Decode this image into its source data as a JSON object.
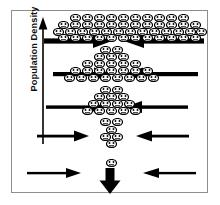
{
  "figure": {
    "title": "Population Density selection funnel diagram",
    "background_color": "#ffffff",
    "frame_color": "#8d8d8d",
    "ink_color": "#000000"
  },
  "y_axis": {
    "label": "Population Density",
    "direction": "up",
    "arrow_icon": "up-arrow-icon",
    "meaning_high": "high density at top",
    "meaning_low": "low density at bottom"
  },
  "chart_data": {
    "type": "diagram",
    "title": "Population Density",
    "xlabel": "",
    "ylabel": "Population Density",
    "grid": false,
    "legend": false,
    "levels": [
      {
        "index": 1,
        "y": 40,
        "population_count": 62,
        "density": "very high",
        "left_arrow": {
          "x_start": 48,
          "x_end": 108,
          "length": 60,
          "thickness": 5
        },
        "right_arrow": {
          "x_start": 196,
          "x_end": 124,
          "length": 72,
          "thickness": 5
        },
        "gap_between_arrows": 16
      },
      {
        "index": 2,
        "y": 73,
        "population_count": 26,
        "density": "high",
        "left_arrow": {
          "x_start": 57,
          "x_end": 108,
          "length": 51,
          "thickness": 4
        },
        "right_arrow": {
          "x_start": 190,
          "x_end": 124,
          "length": 66,
          "thickness": 4
        },
        "gap_between_arrows": 16
      },
      {
        "index": 3,
        "y": 106,
        "population_count": 18,
        "density": "medium",
        "left_arrow": {
          "x_start": 50,
          "x_end": 106,
          "length": 56,
          "thickness": 3
        },
        "right_arrow": {
          "x_start": 180,
          "x_end": 124,
          "length": 56,
          "thickness": 3
        },
        "gap_between_arrows": 18
      },
      {
        "index": 4,
        "y": 135,
        "population_count": 5,
        "density": "low",
        "left_arrow": {
          "x_start": 41,
          "x_end": 89,
          "length": 48,
          "thickness": 2.6
        },
        "right_arrow": {
          "x_start": 186,
          "x_end": 137,
          "length": 49,
          "thickness": 2.6
        },
        "gap_between_arrows": 48
      },
      {
        "index": 5,
        "y": 172,
        "population_count": 1,
        "density": "very low",
        "left_arrow": {
          "x_start": 30,
          "x_end": 80,
          "length": 50,
          "thickness": 2.2
        },
        "right_arrow": {
          "x_start": 193,
          "x_end": 143,
          "length": 50,
          "thickness": 2.2
        },
        "gap_between_arrows": 63
      }
    ],
    "outcome": {
      "icon": "thick-down-arrow-icon",
      "x": 110,
      "y": 181,
      "meaning": "single surviving individual passes through"
    },
    "person_icon": {
      "name": "person-face-icon",
      "width": 11,
      "height": 8,
      "fill": "#ffffff",
      "stroke": "#000000",
      "total_drawn": 112
    }
  },
  "crowd_rows": [
    {
      "y": 14,
      "xs": [
        70,
        82,
        94,
        106,
        118,
        130,
        142,
        154,
        166,
        178
      ]
    },
    {
      "y": 21,
      "xs": [
        58,
        70,
        82,
        94,
        106,
        118,
        130,
        142,
        154,
        166,
        178,
        190
      ]
    },
    {
      "y": 28,
      "xs": [
        53,
        65,
        77,
        89,
        101,
        113,
        125,
        137,
        149,
        161,
        173,
        185,
        196
      ]
    },
    {
      "y": 34,
      "xs": [
        58,
        70,
        82,
        94,
        106,
        118,
        130,
        142,
        154,
        166,
        178,
        190
      ]
    },
    {
      "y": 46,
      "xs": [
        100,
        112
      ]
    },
    {
      "y": 53,
      "xs": [
        94,
        106,
        118
      ]
    },
    {
      "y": 60,
      "xs": [
        82,
        94,
        106,
        118,
        130
      ]
    },
    {
      "y": 67,
      "xs": [
        70,
        82,
        94,
        106,
        118,
        130,
        142
      ]
    },
    {
      "y": 74,
      "xs": [
        64,
        76,
        88,
        100,
        112,
        124,
        136,
        148
      ]
    },
    {
      "y": 86,
      "xs": [
        100,
        112
      ]
    },
    {
      "y": 93,
      "xs": [
        94,
        106,
        118
      ]
    },
    {
      "y": 100,
      "xs": [
        88,
        100,
        112,
        124
      ]
    },
    {
      "y": 107,
      "xs": [
        82,
        94,
        106,
        118,
        130
      ]
    },
    {
      "y": 118,
      "xs": [
        100,
        112
      ]
    },
    {
      "y": 126,
      "xs": [
        106
      ]
    },
    {
      "y": 133,
      "xs": [
        100,
        112
      ]
    },
    {
      "y": 140,
      "xs": [
        106
      ]
    },
    {
      "y": 159,
      "xs": [
        106
      ]
    }
  ]
}
